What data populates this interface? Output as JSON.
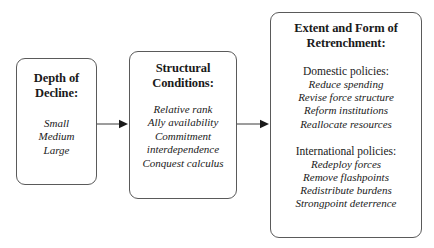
{
  "diagram": {
    "line_color": "#5a5a5a",
    "text_color": "#1a1a1a",
    "background_color": "#ffffff"
  },
  "boxes": {
    "decline": {
      "title": "Depth of\nDecline:",
      "items": "Small\nMedium\nLarge"
    },
    "structural": {
      "title": "Structural\nConditions:",
      "items": "Relative rank\nAlly availability\nCommitment\ninterdependence\nConquest calculus"
    },
    "retrenchment": {
      "title": "Extent and Form of\nRetrenchment:",
      "groups": [
        {
          "heading": "Domestic policies:",
          "items": "Reduce spending\nRevise force structure\nReform institutions\nReallocate resources"
        },
        {
          "heading": "International policies:",
          "items": "Redeploy forces\nRemove flashpoints\nRedistribute burdens\nStrongpoint deterrence"
        }
      ]
    }
  },
  "arrows": [
    {
      "name": "arrow-decline-to-structural",
      "from": "decline",
      "to": "structural"
    },
    {
      "name": "arrow-structural-to-retrenchment",
      "from": "structural",
      "to": "retrenchment"
    }
  ]
}
